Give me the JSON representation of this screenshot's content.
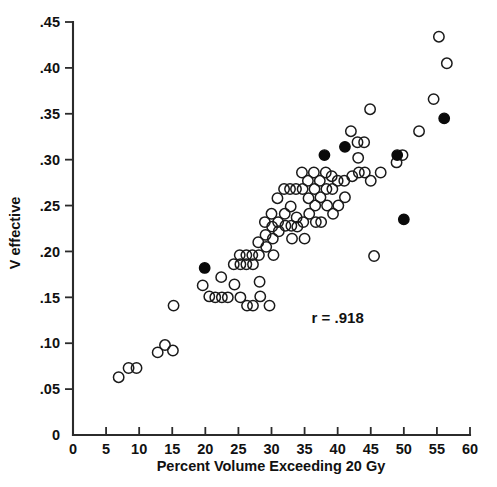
{
  "chart_data": {
    "type": "scatter",
    "title": "",
    "xlabel": "Percent Volume Exceeding 20 Gy",
    "ylabel": "V effective",
    "xlim": [
      0,
      60
    ],
    "ylim": [
      0,
      0.45
    ],
    "grid": false,
    "legend": "none",
    "annotations": [
      {
        "text": "r = .918",
        "x": 40,
        "y": 0.122
      }
    ],
    "xticks": [
      0,
      5,
      10,
      15,
      20,
      25,
      30,
      35,
      40,
      45,
      50,
      55,
      60
    ],
    "xtick_labels": [
      "0",
      "5",
      "10",
      "15",
      "20",
      "25",
      "30",
      "35",
      "40",
      "45",
      "50",
      "55",
      "60"
    ],
    "yticks": [
      0,
      0.05,
      0.1,
      0.15,
      0.2,
      0.25,
      0.3,
      0.35,
      0.4,
      0.45
    ],
    "ytick_labels": [
      "0",
      ".05",
      ".10",
      ".15",
      ".20",
      ".25",
      ".30",
      ".35",
      ".40",
      ".45"
    ],
    "series": [
      {
        "name": "open-markers",
        "marker": "open-circle",
        "color": "#1a1a1a",
        "points": [
          [
            6.9,
            0.063
          ],
          [
            8.4,
            0.073
          ],
          [
            9.6,
            0.073
          ],
          [
            12.8,
            0.09
          ],
          [
            13.9,
            0.098
          ],
          [
            15.1,
            0.092
          ],
          [
            15.2,
            0.141
          ],
          [
            19.6,
            0.163
          ],
          [
            20.6,
            0.151
          ],
          [
            21.5,
            0.15
          ],
          [
            22.4,
            0.172
          ],
          [
            22.5,
            0.15
          ],
          [
            23.4,
            0.15
          ],
          [
            24.3,
            0.186
          ],
          [
            24.4,
            0.164
          ],
          [
            25.2,
            0.196
          ],
          [
            25.3,
            0.186
          ],
          [
            25.3,
            0.15
          ],
          [
            26.2,
            0.196
          ],
          [
            26.2,
            0.186
          ],
          [
            26.3,
            0.141
          ],
          [
            27.1,
            0.196
          ],
          [
            27.2,
            0.186
          ],
          [
            27.2,
            0.141
          ],
          [
            28.0,
            0.21
          ],
          [
            28.1,
            0.196
          ],
          [
            28.2,
            0.167
          ],
          [
            28.3,
            0.151
          ],
          [
            29.0,
            0.232
          ],
          [
            29.1,
            0.218
          ],
          [
            29.2,
            0.205
          ],
          [
            29.7,
            0.141
          ],
          [
            30.0,
            0.241
          ],
          [
            30.1,
            0.227
          ],
          [
            30.2,
            0.214
          ],
          [
            30.3,
            0.196
          ],
          [
            30.9,
            0.258
          ],
          [
            31.0,
            0.232
          ],
          [
            31.1,
            0.222
          ],
          [
            31.9,
            0.268
          ],
          [
            32.0,
            0.241
          ],
          [
            32.1,
            0.228
          ],
          [
            32.8,
            0.268
          ],
          [
            32.9,
            0.249
          ],
          [
            33.0,
            0.228
          ],
          [
            33.1,
            0.214
          ],
          [
            33.7,
            0.268
          ],
          [
            33.8,
            0.237
          ],
          [
            33.9,
            0.227
          ],
          [
            34.6,
            0.286
          ],
          [
            34.7,
            0.268
          ],
          [
            34.8,
            0.232
          ],
          [
            35.0,
            0.214
          ],
          [
            35.5,
            0.277
          ],
          [
            35.6,
            0.258
          ],
          [
            35.7,
            0.241
          ],
          [
            36.4,
            0.286
          ],
          [
            36.5,
            0.268
          ],
          [
            36.6,
            0.25
          ],
          [
            36.7,
            0.232
          ],
          [
            37.3,
            0.277
          ],
          [
            37.4,
            0.259
          ],
          [
            37.5,
            0.232
          ],
          [
            38.2,
            0.286
          ],
          [
            38.3,
            0.268
          ],
          [
            38.4,
            0.25
          ],
          [
            39.1,
            0.282
          ],
          [
            39.2,
            0.268
          ],
          [
            39.3,
            0.241
          ],
          [
            40.0,
            0.277
          ],
          [
            40.1,
            0.25
          ],
          [
            41.0,
            0.277
          ],
          [
            41.1,
            0.259
          ],
          [
            42.0,
            0.331
          ],
          [
            42.2,
            0.282
          ],
          [
            43.0,
            0.319
          ],
          [
            43.1,
            0.302
          ],
          [
            43.2,
            0.286
          ],
          [
            44.0,
            0.319
          ],
          [
            44.1,
            0.286
          ],
          [
            44.9,
            0.355
          ],
          [
            45.0,
            0.277
          ],
          [
            45.5,
            0.195
          ],
          [
            46.5,
            0.286
          ],
          [
            48.9,
            0.297
          ],
          [
            49.8,
            0.305
          ],
          [
            52.3,
            0.331
          ],
          [
            54.5,
            0.366
          ],
          [
            55.3,
            0.434
          ],
          [
            56.5,
            0.405
          ]
        ]
      },
      {
        "name": "filled-markers",
        "marker": "filled-circle",
        "color": "#0a0a0a",
        "points": [
          [
            19.9,
            0.182
          ],
          [
            38.0,
            0.305
          ],
          [
            41.1,
            0.314
          ],
          [
            49.0,
            0.305
          ],
          [
            50.0,
            0.235
          ],
          [
            56.1,
            0.345
          ]
        ]
      }
    ]
  },
  "layout": {
    "plot_left_px": 73,
    "plot_right_px": 470,
    "plot_top_px": 22,
    "plot_bottom_px": 435,
    "marker_radius_px": 5.2
  },
  "figure": {
    "caption_fragment": ""
  }
}
